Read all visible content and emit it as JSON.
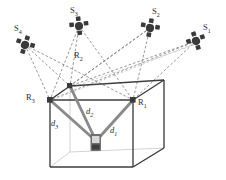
{
  "figure": {
    "background_color": "#ffffff",
    "width": 226,
    "height": 180
  },
  "colors": {
    "node_dark": "#3a3a3a",
    "ray_dashed": "#6b6b6b",
    "ray_dashed_light": "#b9b9b9",
    "distance_line": "#8a8a8a",
    "box_edge": "#3d3d3d",
    "box_edge_hidden": "#c8c8c8",
    "label_text": "#2b2b2b",
    "device_body": "#6e6e6e",
    "device_screen": "#d8d8d8"
  },
  "sources": [
    {
      "id": "S1",
      "label": "S",
      "sub": "1",
      "name": "loudspeaker-s1",
      "x": 196,
      "y": 41,
      "label_x": 204,
      "label_y": 28
    },
    {
      "id": "S2",
      "label": "S",
      "sub": "2",
      "name": "loudspeaker-s2",
      "x": 150,
      "y": 28,
      "label_x": 154,
      "label_y": 12
    },
    {
      "id": "S3",
      "label": "S",
      "sub": "3",
      "name": "loudspeaker-s3",
      "x": 79,
      "y": 26,
      "label_x": 71,
      "label_y": 11
    },
    {
      "id": "S4",
      "label": "S",
      "sub": "4",
      "name": "loudspeaker-s4",
      "x": 25,
      "y": 45,
      "label_x": 15,
      "label_y": 30
    }
  ],
  "receivers": [
    {
      "id": "R1",
      "label": "R",
      "sub": "1",
      "name": "receiver-r1",
      "x": 133,
      "y": 100,
      "label_x": 139,
      "label_y": 102
    },
    {
      "id": "R2",
      "label": "R",
      "sub": "2",
      "name": "receiver-r2",
      "x": 70,
      "y": 86,
      "label_x": 76,
      "label_y": 55
    },
    {
      "id": "R3",
      "label": "R",
      "sub": "3",
      "name": "receiver-r3",
      "x": 50,
      "y": 100,
      "label_x": 27,
      "label_y": 98
    }
  ],
  "device": {
    "name": "mobile-device",
    "x": 96,
    "y": 141
  },
  "distances": [
    {
      "id": "d1",
      "label": "d",
      "sub": "1",
      "name": "distance-d1",
      "from": "R1",
      "label_x": 112,
      "label_y": 130
    },
    {
      "id": "d2",
      "label": "d",
      "sub": "2",
      "name": "distance-d2",
      "from": "R2",
      "label_x": 88,
      "label_y": 113
    },
    {
      "id": "d3",
      "label": "d",
      "sub": "3",
      "name": "distance-d3",
      "from": "R3",
      "label_x": 53,
      "label_y": 124
    }
  ],
  "box": {
    "name": "room-cuboid",
    "front_top_left": {
      "x": 50,
      "y": 100
    },
    "front_top_right": {
      "x": 133,
      "y": 100
    },
    "front_bottom_left": {
      "x": 50,
      "y": 167
    },
    "front_bottom_right": {
      "x": 133,
      "y": 167
    },
    "back_top_left": {
      "x": 70,
      "y": 86
    },
    "back_top_right": {
      "x": 164,
      "y": 80
    },
    "back_bottom_left": {
      "x": 70,
      "y": 152
    },
    "back_bottom_right": {
      "x": 164,
      "y": 148
    }
  },
  "rays": {
    "name": "propagation-rays",
    "style": "dashed",
    "description": "Dashed lines from each loudspeaker to each receiver"
  }
}
